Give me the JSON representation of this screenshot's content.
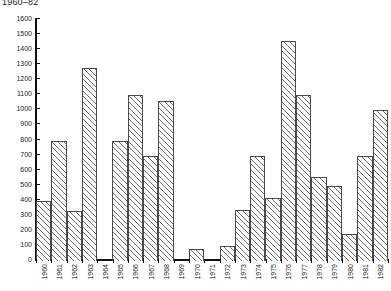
{
  "chart_data": {
    "type": "bar",
    "title": "1960–82",
    "xlabel": "",
    "ylabel": "",
    "ylim": [
      0,
      1600
    ],
    "ytick_step": 100,
    "grid": false,
    "legend": null,
    "categories": [
      "1960",
      "1961",
      "1962",
      "1963",
      "1964",
      "1965",
      "1966",
      "1967",
      "1968",
      "1969",
      "1970",
      "1971",
      "1972",
      "1973",
      "1974",
      "1975",
      "1976",
      "1977",
      "1978",
      "1979",
      "1980",
      "1981",
      "1982"
    ],
    "values": [
      400,
      800,
      330,
      1280,
      0,
      800,
      1100,
      700,
      1060,
      0,
      80,
      0,
      100,
      340,
      700,
      420,
      1460,
      1100,
      560,
      500,
      180,
      700,
      1000
    ],
    "yticks": [
      "0",
      "100",
      "200",
      "300",
      "400",
      "500",
      "600",
      "700",
      "800",
      "900",
      "1000",
      "1100",
      "1200",
      "1300",
      "1400",
      "1500",
      "1600"
    ]
  }
}
